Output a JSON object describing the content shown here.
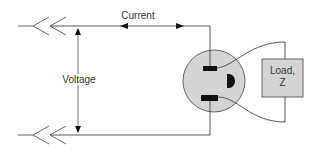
{
  "diagram": {
    "type": "electrical-outlet-circuit",
    "labels": {
      "current": "Current",
      "voltage": "Voltage",
      "load_line1": "Load,",
      "load_line2": "Z"
    },
    "components": [
      {
        "id": "top-conductor",
        "kind": "wire",
        "description": "Top supply conductor entering from left via connector"
      },
      {
        "id": "bottom-conductor",
        "kind": "wire",
        "description": "Bottom supply conductor entering from left via connector"
      },
      {
        "id": "current-arrow",
        "kind": "double-arrow",
        "label": "Current"
      },
      {
        "id": "voltage-arrow",
        "kind": "double-arrow",
        "label": "Voltage"
      },
      {
        "id": "outlet",
        "kind": "receptacle",
        "prongs": 2,
        "ground": true
      },
      {
        "id": "load",
        "kind": "box",
        "label": "Load, Z"
      }
    ],
    "colors": {
      "line": "#444444",
      "outlet_fill": "#d4d4d4",
      "load_fill": "#d4d4d4",
      "prong": "#111111",
      "text": "#333333"
    }
  }
}
